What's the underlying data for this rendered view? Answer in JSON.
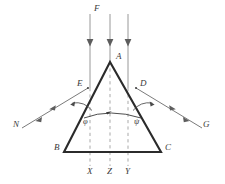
{
  "figure": {
    "type": "optics-prism-ray-diagram",
    "background": "#ffffff",
    "line_color": "#3a3a3a",
    "prism_color": "#2b2b2b",
    "ray_color": "#6b6b6b",
    "dash_color": "#8a8a8a"
  },
  "labels": {
    "incident_beam": "F",
    "apex": "A",
    "left_face_point": "E",
    "right_face_point": "D",
    "base_left": "B",
    "base_right": "C",
    "exit_left": "N",
    "exit_right": "G",
    "angle_left": "φ",
    "angle_right": "ψ",
    "axis_left": "X",
    "axis_center": "Z",
    "axis_right": "Y"
  },
  "geometry": {
    "apex": [
      110,
      62
    ],
    "base_left": [
      64,
      152
    ],
    "base_right": [
      161,
      152
    ],
    "point_e": [
      88,
      88
    ],
    "point_d": [
      136,
      88
    ],
    "rays_x": [
      90,
      110,
      128
    ],
    "ray_top_y": 14,
    "dash_bottom_y": 166
  }
}
